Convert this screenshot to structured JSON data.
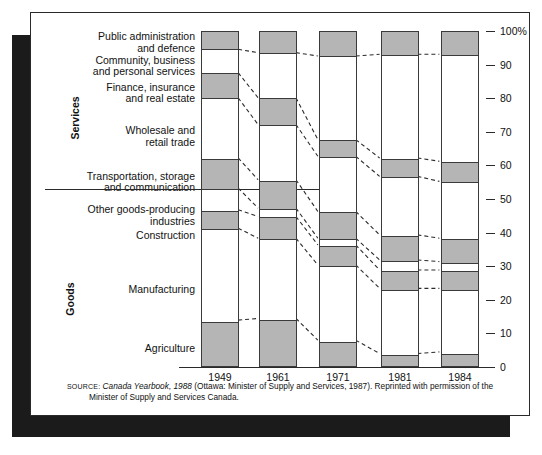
{
  "chart_data": {
    "type": "area",
    "title": "",
    "subtitle": "",
    "xlabel": "",
    "ylabel": "",
    "categories": [
      "1949",
      "1961",
      "1971",
      "1981",
      "1984"
    ],
    "ylim": [
      0,
      100
    ],
    "yticks": [
      0,
      10,
      20,
      30,
      40,
      50,
      60,
      70,
      80,
      90,
      100
    ],
    "ytick_labels": [
      "0",
      "10",
      "20",
      "30",
      "40",
      "50",
      "60",
      "70",
      "80",
      "90",
      "100%"
    ],
    "grid": false,
    "legend": "none",
    "stacked_percent": true,
    "note": "Percentage shares of employment by industry; segments stack to 100%",
    "group_labels": [
      "Services",
      "Goods"
    ],
    "group_divider_value": 46.5,
    "series": [
      {
        "name": "Public administration and defence",
        "group": "Services",
        "fill": "gray",
        "values": [
          5.5,
          6.5,
          7.5,
          7.0,
          7.0
        ]
      },
      {
        "name": "Community, business and personal services",
        "group": "Services",
        "fill": "white",
        "values": [
          7.0,
          13.5,
          25.0,
          31.0,
          32.0
        ]
      },
      {
        "name": "Finance, insurance and real estate",
        "group": "Services",
        "fill": "gray",
        "values": [
          7.5,
          8.0,
          5.0,
          5.5,
          6.0
        ]
      },
      {
        "name": "Wholesale and retail trade",
        "group": "Services",
        "fill": "white",
        "values": [
          18.0,
          16.5,
          16.5,
          17.5,
          17.0
        ]
      },
      {
        "name": "Transportation, storage and communication",
        "group": "Services",
        "fill": "gray",
        "values": [
          9.0,
          8.5,
          8.0,
          7.5,
          7.0
        ]
      },
      {
        "name": "Other goods-producing industries",
        "group": "Goods",
        "fill": "white",
        "values": [
          6.5,
          2.5,
          2.0,
          3.0,
          2.5
        ]
      },
      {
        "name": "Construction",
        "group": "Goods",
        "fill": "gray",
        "values": [
          5.5,
          6.5,
          6.0,
          5.5,
          5.5
        ]
      },
      {
        "name": "Manufacturing",
        "group": "Goods",
        "fill": "white",
        "values": [
          27.5,
          24.0,
          22.5,
          19.5,
          19.0
        ]
      },
      {
        "name": "Agriculture",
        "group": "Goods",
        "fill": "gray",
        "values": [
          13.5,
          14.0,
          7.5,
          3.5,
          4.0
        ]
      }
    ]
  },
  "axis": {
    "labels": [
      "100%",
      "90",
      "80",
      "70",
      "60",
      "50",
      "40",
      "30",
      "20",
      "10",
      "0"
    ]
  },
  "categories": {
    "items": [
      {
        "line1": "Public administration",
        "line2": "and defence"
      },
      {
        "line1": "Community, business",
        "line2": "and personal services"
      },
      {
        "line1": "Finance, insurance",
        "line2": "and real estate"
      },
      {
        "line1": "Wholesale and",
        "line2": "retail trade"
      },
      {
        "line1": "Transportation, storage",
        "line2": "and communication"
      },
      {
        "line1": "Other goods-producing",
        "line2": "industries"
      },
      {
        "line1": "Construction",
        "line2": ""
      },
      {
        "line1": "Manufacturing",
        "line2": ""
      },
      {
        "line1": "Agriculture",
        "line2": ""
      }
    ]
  },
  "groups": {
    "services": "Services",
    "goods": "Goods"
  },
  "years": [
    "1949",
    "1961",
    "1971",
    "1981",
    "1984"
  ],
  "source": {
    "label": "SOURCE:",
    "italic": "Canada Yearbook, 1988",
    "rest": "(Ottawa: Minister of Supply and Services, 1987). Reprinted with permission of the",
    "line2": "Minister of Supply and Services Canada."
  },
  "colors": {
    "gray_fill": "#b5b5b5",
    "white_fill": "#ffffff",
    "stroke": "#3a3a3a",
    "shadow": "#1b1b1b",
    "frame": "#2a2a2a"
  }
}
